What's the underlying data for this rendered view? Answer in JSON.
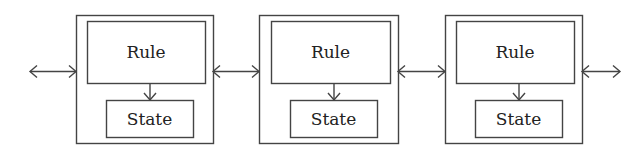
{
  "diagram": {
    "type": "cellular-chain",
    "stroke_color": "#444444",
    "text_color": "#222222",
    "background": "#ffffff",
    "cells": [
      {
        "id": "cell-1",
        "rule_label": "Rule",
        "state_label": "State",
        "outer": {
          "x": 76,
          "y": 15,
          "w": 137,
          "h": 128
        },
        "rule": {
          "x": 87,
          "y": 21,
          "w": 118,
          "h": 62
        },
        "state": {
          "x": 106,
          "y": 100,
          "w": 87,
          "h": 37
        }
      },
      {
        "id": "cell-2",
        "rule_label": "Rule",
        "state_label": "State",
        "outer": {
          "x": 259,
          "y": 15,
          "w": 139,
          "h": 128
        },
        "rule": {
          "x": 271,
          "y": 21,
          "w": 119,
          "h": 62
        },
        "state": {
          "x": 290,
          "y": 100,
          "w": 87,
          "h": 37
        }
      },
      {
        "id": "cell-3",
        "rule_label": "Rule",
        "state_label": "State",
        "outer": {
          "x": 445,
          "y": 15,
          "w": 137,
          "h": 128
        },
        "rule": {
          "x": 456,
          "y": 21,
          "w": 118,
          "h": 62
        },
        "state": {
          "x": 475,
          "y": 100,
          "w": 87,
          "h": 37
        }
      }
    ],
    "connectors": [
      {
        "id": "left-edge",
        "type": "bidirectional",
        "x1": 30,
        "x2": 76,
        "y": 71
      },
      {
        "id": "cell1-cell2",
        "type": "bidirectional",
        "x1": 213,
        "x2": 259,
        "y": 71
      },
      {
        "id": "cell2-cell3",
        "type": "bidirectional",
        "x1": 398,
        "x2": 445,
        "y": 71
      },
      {
        "id": "right-edge",
        "type": "bidirectional",
        "x1": 582,
        "x2": 620,
        "y": 71
      }
    ]
  }
}
